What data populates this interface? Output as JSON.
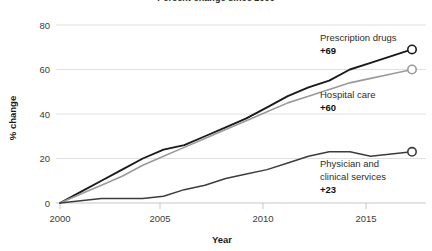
{
  "chart_data": {
    "type": "line",
    "title": "Percent change since 2000",
    "xlabel": "Year",
    "ylabel": "% change",
    "xlim": [
      2000,
      2017
    ],
    "ylim": [
      0,
      80
    ],
    "xticks": [
      2000,
      2005,
      2010,
      2015
    ],
    "xtick_labels": [
      "2000",
      "2005",
      "2010",
      "2015"
    ],
    "yticks": [
      0,
      20,
      40,
      60,
      80
    ],
    "ytick_labels": [
      "0",
      "20",
      "40",
      "60",
      "80"
    ],
    "grid": "horizontal",
    "legend": "inline-annotations",
    "x": [
      2000,
      2001,
      2002,
      2003,
      2004,
      2005,
      2006,
      2007,
      2008,
      2009,
      2010,
      2011,
      2012,
      2013,
      2014,
      2015,
      2016,
      2017
    ],
    "series": [
      {
        "name": "Prescription drugs",
        "label_value": "+69",
        "color": "#1a1a1a",
        "width": 1.9,
        "values": [
          0,
          5,
          10,
          15,
          20,
          24,
          26,
          30,
          34,
          38,
          43,
          48,
          52,
          55,
          60,
          63,
          66,
          69
        ]
      },
      {
        "name": "Hospital care",
        "label_value": "+60",
        "color": "#9a9a9a",
        "width": 1.6,
        "values": [
          0,
          4,
          8,
          12,
          17,
          21,
          25,
          29,
          33,
          37,
          41,
          45,
          48,
          51,
          54,
          56,
          58,
          60
        ]
      },
      {
        "name": "Physician and clinical services",
        "label_value": "+23",
        "color": "#3c3c3c",
        "width": 1.5,
        "values": [
          0,
          1,
          2,
          2,
          2,
          3,
          6,
          8,
          11,
          13,
          15,
          18,
          21,
          23,
          23,
          21,
          22,
          23
        ]
      }
    ],
    "annotations": [
      {
        "name": "Prescription drugs",
        "value": "+23"
      }
    ]
  },
  "labels": {
    "series_0_name": "Prescription drugs",
    "series_0_value": "+69",
    "series_1_name": "Hospital care",
    "series_1_value": "+60",
    "series_2_name_line1": "Physician and",
    "series_2_name_line2": "clinical services",
    "series_2_value": "+23"
  }
}
